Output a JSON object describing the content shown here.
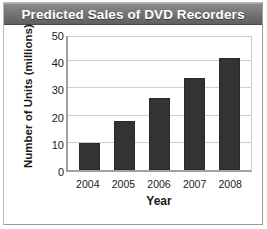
{
  "chart_data": {
    "type": "bar",
    "title": "Predicted Sales of DVD Recorders",
    "xlabel": "Year",
    "ylabel": "Number of Units (millions)",
    "categories": [
      "2004",
      "2005",
      "2006",
      "2007",
      "2008"
    ],
    "values": [
      10,
      18,
      26.5,
      34,
      41
    ],
    "ylim": [
      0,
      50
    ],
    "yticks": [
      0,
      10,
      20,
      30,
      40,
      50
    ],
    "ytick_labels": [
      "0",
      "10",
      "20",
      "30",
      "40",
      "50"
    ],
    "grid": "horizontal",
    "legend": null,
    "series": [
      {
        "name": "Predicted units",
        "values": [
          10,
          18,
          26.5,
          34,
          41
        ]
      }
    ],
    "colors": {
      "bar": "#333333",
      "grid": "#cfcfcf",
      "axis": "#a0a0a0",
      "title_bar": "#757575",
      "title_text": "#ffffff",
      "text": "#1a1a1a",
      "background": "#ffffff"
    }
  }
}
